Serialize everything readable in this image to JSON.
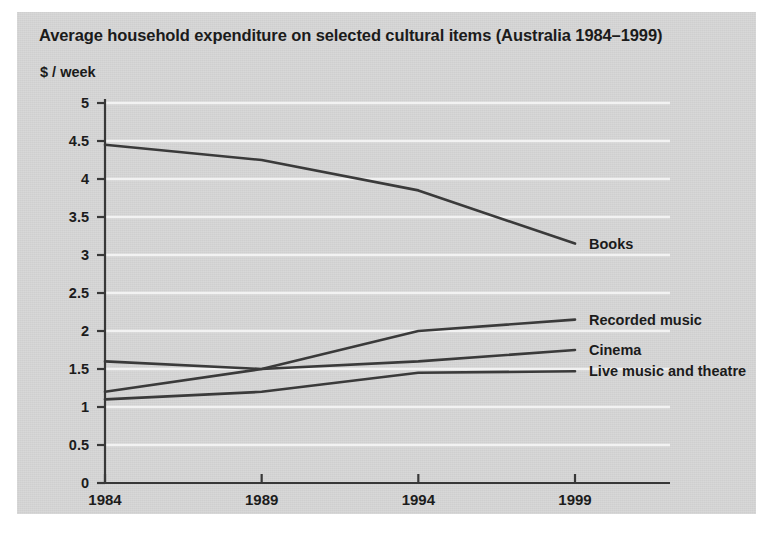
{
  "chart_data": {
    "type": "line",
    "title": "Average household expenditure on selected cultural items (Australia 1984–1999)",
    "ylabel": "$ / week",
    "xlabel": "",
    "x": [
      1984,
      1989,
      1994,
      1999
    ],
    "xtick_labels": [
      "1984",
      "1989",
      "1994",
      "1999"
    ],
    "ytick_labels": [
      "0",
      "0.5",
      "1",
      "1.5",
      "2",
      "2.5",
      "3",
      "3.5",
      "4",
      "4.5",
      "5"
    ],
    "ytick_values": [
      0,
      0.5,
      1,
      1.5,
      2,
      2.5,
      3,
      3.5,
      4,
      4.5,
      5
    ],
    "ylim": [
      0,
      5
    ],
    "xlim": [
      1984,
      1999
    ],
    "grid": true,
    "grid_color": "#f2f2f2",
    "legend_position": "right-inline",
    "line_color": "#3a3a3a",
    "series": [
      {
        "name": "Books",
        "values": [
          4.45,
          4.25,
          3.85,
          3.15
        ]
      },
      {
        "name": "Recorded music",
        "values": [
          1.2,
          1.5,
          2.0,
          2.15
        ]
      },
      {
        "name": "Cinema",
        "values": [
          1.6,
          1.5,
          1.6,
          1.75
        ]
      },
      {
        "name": "Live music and theatre",
        "values": [
          1.1,
          1.2,
          1.45,
          1.47
        ]
      }
    ]
  },
  "labels": {
    "series_labels": [
      "Books",
      "Recorded music",
      "Cinema",
      "Live music and theatre"
    ]
  }
}
